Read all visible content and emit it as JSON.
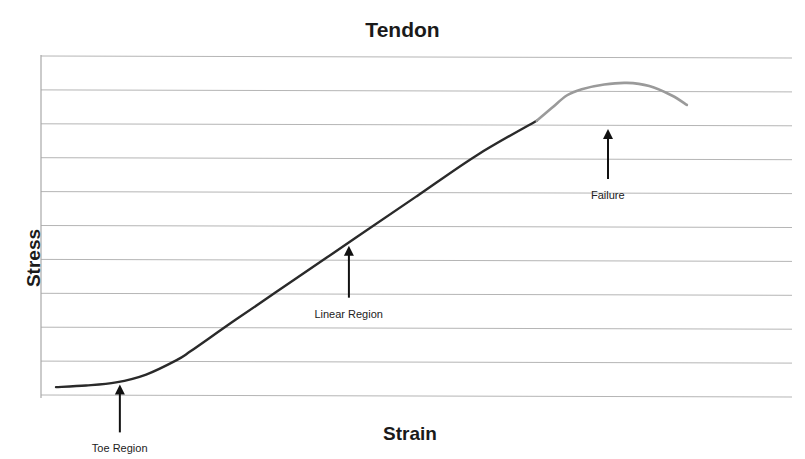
{
  "chart_data": {
    "type": "line",
    "title": "Tendon",
    "xlabel": "Strain",
    "ylabel": "Stress",
    "grid": true,
    "gridlines_y": 11,
    "tick_labels": false,
    "legend": null,
    "xlim": [
      0,
      100
    ],
    "ylim": [
      0,
      100
    ],
    "series": [
      {
        "name": "Toe + Linear region",
        "color": "#2a2a2a",
        "x": [
          2,
          6,
          10,
          14,
          18,
          20,
          26,
          34,
          42,
          50,
          58,
          66
        ],
        "y": [
          2.5,
          3,
          4,
          6.5,
          11,
          14,
          24,
          37,
          50,
          63,
          76,
          87
        ]
      },
      {
        "name": "Failure region",
        "color": "#9a9a9a",
        "x": [
          66,
          68,
          70,
          72,
          75,
          78,
          81,
          84,
          86
        ],
        "y": [
          87,
          91,
          95,
          97,
          98.5,
          99,
          98,
          95,
          92
        ]
      }
    ],
    "annotations": [
      {
        "text": "Toe Region",
        "arrow_x": 10.5,
        "arrow_y_tip": 4,
        "label_position": "below"
      },
      {
        "text": "Linear Region",
        "arrow_x": 41,
        "arrow_y_tip": 48,
        "label_position": "below"
      },
      {
        "text": "Failure",
        "arrow_x": 75.5,
        "arrow_y_tip": 85,
        "label_position": "below"
      }
    ]
  },
  "colors": {
    "grid": "#b5b5b5",
    "axis": "#a8a8a8",
    "curve_main": "#2a2a2a",
    "curve_failure": "#9a9a9a",
    "text": "#1a1a1a"
  }
}
